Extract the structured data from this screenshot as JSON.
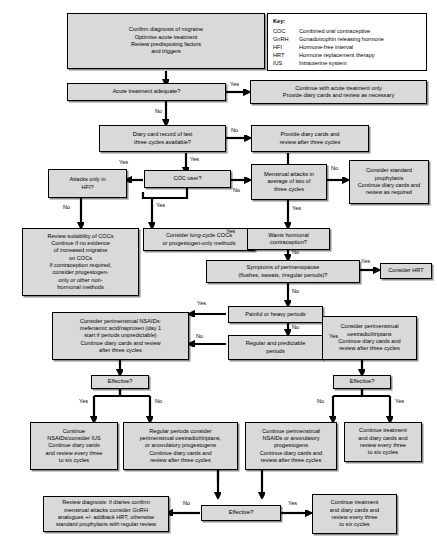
{
  "document": {
    "title": "Management of menstrual migraine flowchart",
    "type": "clinical-algorithm-flowchart"
  },
  "key": {
    "title": "Key:",
    "entries": [
      {
        "abbr": "COC",
        "meaning": "Combined oral contraceptive"
      },
      {
        "abbr": "GnRH",
        "meaning": "Gonadotrophin releasing hormone"
      },
      {
        "abbr": "HFI",
        "meaning": "Hormone-free interval"
      },
      {
        "abbr": "HRT",
        "meaning": "Hormone replacement therapy"
      },
      {
        "abbr": "IUS",
        "meaning": "Intrauterine system"
      }
    ]
  },
  "nodes": {
    "start": "Confirm diagnosis of migraine\nOptimise acute treatment\nReview predisposing factors\nand triggers",
    "acute_adequate": "Acute treatment adequate?",
    "continue_acute": "Continue with acute treatment only\nProvide diary cards and review as necessary",
    "diary_record": "Diary card record of last\nthree cycles available?",
    "provide_diary": "Provide diary cards and\nreview after three cycles",
    "attacks_hfi": "Attacks only in\nHFI?",
    "coc_user": "COC user?",
    "menstrual_attacks": "Menstrual attacks in\naverage of two of\nthree cycles",
    "standard_prophylaxis": "Consider standard\nprophylaxis\nContinue diary cards and\nreview as required",
    "review_cocs": "Review suitability of COCs\nContinue if no evidence\nof increased migraine\non COCs\nIf contraception required,\nconsider progestogen-\nonly or other non-\nhormonal methods",
    "long_cycle": "Consider long-cycle COCs\nor progestogen-only methods",
    "wants_hormonal": "Wants hormonal\ncontraception?",
    "perimenopause": "Symptoms of perimenopause\n(flushes, sweats, irregular periods)?",
    "consider_hrt": "Consider HRT",
    "painful_heavy": "Painful or heavy periods",
    "regular_predictable": "Regular and predictable\nperiods",
    "nsaids_left": "Consider perimenstrual NSAIDs:\nmefenamic acid/naproxen (day 1\nstart if periods unpredictable)\nContinue diary cards and review\nafter three cycles",
    "oestradiol_right": "Consider perimenstrual\noestradiol/triptans\nContinue diary cards and\nreview after three cycles",
    "effective_left": "Effective?",
    "effective_right": "Effective?",
    "continue_nsaids_ius": "Continue\nNSAIDs/consider IUS\nContinue diary cards\nand review every three\nto six cycles",
    "regular_periods_consider": "Regular periods consider\nperimenstrual oestradiol/triptans,\nor anovulatory progestogens\nContinue diary cards and\nreview after three cycles",
    "continue_perimenstrual": "Continue perimenstrual\nNSAIDs or anovulatory\nprogestogens\nContinue diary cards and\nreview after three cycles",
    "continue_treatment_right": "Continue treatment\nand diary cards and\nreview every three\nto six cycles",
    "review_diagnosis": "Review diagnosis: if diaries confirm\nmenstrual attacks consider GnRH\nanalogues +/- addback HRT; otherwise\nstandard prophylaxis with regular review",
    "effective_bottom": "Effective?",
    "continue_treatment_bottom": "Continue treatment\nand diary cards and\nreview every three\nto six cycles"
  },
  "edge_labels": {
    "acute_yes": "Yes",
    "acute_no": "No",
    "diary_no": "No",
    "diary_yes": "Yes",
    "coc_yes_left": "Yes",
    "coc_yes_down": "Yes",
    "coc_no": "No",
    "hfi_no": "No",
    "menstrual_no": "No",
    "menstrual_yes": "Yes",
    "wants_yes": "Yes",
    "wants_no": "No",
    "perimenopause_yes": "Yes",
    "perimenopause_no": "No",
    "painful_yes": "Yes",
    "painful_no": "No",
    "regular_no": "No",
    "regular_yes": "Yes",
    "effective_left_yes": "Yes",
    "effective_left_no": "No",
    "effective_right_no": "No",
    "effective_right_yes": "Yes",
    "effective_bottom_no": "No",
    "effective_bottom_yes": "Yes"
  },
  "colors": {
    "node_fill": "#d9d9d9",
    "border": "#000000",
    "background": "#ffffff"
  }
}
